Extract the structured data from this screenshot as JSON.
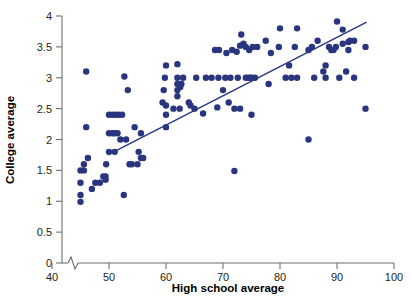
{
  "chart_data": {
    "type": "scatter",
    "title": "",
    "xlabel": "High school average",
    "ylabel": "College average",
    "xlim": [
      37,
      101
    ],
    "ylim": [
      0,
      4
    ],
    "x_ticks": [
      40,
      50,
      60,
      70,
      80,
      90,
      100
    ],
    "y_ticks": [
      0,
      0.5,
      1,
      1.5,
      2,
      2.5,
      3,
      3.5,
      4
    ],
    "x_tick_labels": [
      "40",
      "50",
      "60",
      "70",
      "80",
      "90",
      "100"
    ],
    "y_tick_labels": [
      "0",
      "0.5",
      "1",
      "1.5",
      "2",
      "2.5",
      "3",
      "3.5",
      "4"
    ],
    "grid": false,
    "legend": "none",
    "axis_break": {
      "axis": "x",
      "note": "zigzag break between 0 and 40"
    },
    "marker_color": "#2a3580",
    "marker_size": 3.2,
    "line_color": "#2a3580",
    "trend_line": {
      "type": "linear-fit",
      "x_start": 49.8,
      "y_start": 1.75,
      "x_end": 95.2,
      "y_end": 3.9
    },
    "series": [
      {
        "name": "students",
        "points": [
          [
            45,
            0.99
          ],
          [
            45,
            1.1
          ],
          [
            45,
            1.3
          ],
          [
            45,
            1.5
          ],
          [
            45.6,
            1.5
          ],
          [
            45.6,
            1.6
          ],
          [
            46,
            2.2
          ],
          [
            46,
            3.1
          ],
          [
            46.3,
            1.7
          ],
          [
            47,
            1.2
          ],
          [
            47.6,
            1.3
          ],
          [
            48.4,
            1.3
          ],
          [
            49,
            1.4
          ],
          [
            49.4,
            1.4
          ],
          [
            49.4,
            1.35
          ],
          [
            49.5,
            1.6
          ],
          [
            50,
            1.8
          ],
          [
            50,
            2.1
          ],
          [
            50,
            2.4
          ],
          [
            50.6,
            2.1
          ],
          [
            50.6,
            2.4
          ],
          [
            51,
            1.8
          ],
          [
            51,
            2.1
          ],
          [
            51.2,
            2.4
          ],
          [
            51.5,
            2.1
          ],
          [
            51.7,
            2.4
          ],
          [
            52,
            2.0
          ],
          [
            52.3,
            2.4
          ],
          [
            52.6,
            1.1
          ],
          [
            52.7,
            3.02
          ],
          [
            53,
            2.0
          ],
          [
            53.3,
            2.8
          ],
          [
            53.6,
            1.6
          ],
          [
            54,
            1.6
          ],
          [
            54.5,
            2.2
          ],
          [
            55,
            1.6
          ],
          [
            55.2,
            1.8
          ],
          [
            55.6,
            1.7
          ],
          [
            55.6,
            2.1
          ],
          [
            56,
            1.7
          ],
          [
            59.4,
            2.6
          ],
          [
            59.6,
            2.8
          ],
          [
            59.8,
            3.0
          ],
          [
            60,
            2.2
          ],
          [
            60,
            2.4
          ],
          [
            60,
            2.55
          ],
          [
            60,
            3.2
          ],
          [
            61.3,
            2.5
          ],
          [
            62,
            2.7
          ],
          [
            62,
            2.8
          ],
          [
            62,
            2.9
          ],
          [
            62,
            3.0
          ],
          [
            62,
            3.22
          ],
          [
            62.4,
            2.5
          ],
          [
            62.5,
            2.85
          ],
          [
            62.7,
            2.9
          ],
          [
            63,
            3.0
          ],
          [
            64,
            2.6
          ],
          [
            64.3,
            2.55
          ],
          [
            65,
            2.5
          ],
          [
            65.3,
            3.0
          ],
          [
            66.5,
            2.42
          ],
          [
            67,
            3.0
          ],
          [
            68,
            3.0
          ],
          [
            68.6,
            3.45
          ],
          [
            69,
            2.52
          ],
          [
            69.2,
            3.0
          ],
          [
            69.3,
            3.45
          ],
          [
            70,
            2.8
          ],
          [
            70.4,
            3.0
          ],
          [
            70.6,
            3.4
          ],
          [
            71,
            2.6
          ],
          [
            71.3,
            3.0
          ],
          [
            71.6,
            3.45
          ],
          [
            72,
            1.49
          ],
          [
            72,
            2.5
          ],
          [
            72.4,
            3.42
          ],
          [
            72.6,
            3.0
          ],
          [
            73,
            2.5
          ],
          [
            73,
            3.52
          ],
          [
            73.2,
            3.7
          ],
          [
            73.6,
            3.55
          ],
          [
            74,
            3.0
          ],
          [
            74,
            3.5
          ],
          [
            74.4,
            3.0
          ],
          [
            74.6,
            3.45
          ],
          [
            74.8,
            3.0
          ],
          [
            75,
            2.4
          ],
          [
            75,
            3.0
          ],
          [
            75.2,
            3.5
          ],
          [
            75.6,
            3.0
          ],
          [
            76,
            3.5
          ],
          [
            77.5,
            3.6
          ],
          [
            78,
            2.9
          ],
          [
            78.4,
            3.4
          ],
          [
            79.8,
            3.5
          ],
          [
            80,
            3.8
          ],
          [
            81,
            3.0
          ],
          [
            81.6,
            3.2
          ],
          [
            82,
            3.0
          ],
          [
            82.6,
            3.5
          ],
          [
            83,
            3.0
          ],
          [
            83,
            3.8
          ],
          [
            85,
            2.0
          ],
          [
            85,
            3.45
          ],
          [
            85.6,
            3.5
          ],
          [
            86,
            3.0
          ],
          [
            86.6,
            3.6
          ],
          [
            87.6,
            3.1
          ],
          [
            88,
            3.0
          ],
          [
            88,
            3.2
          ],
          [
            88.6,
            3.5
          ],
          [
            89,
            3.45
          ],
          [
            89.4,
            3.45
          ],
          [
            89.8,
            3.5
          ],
          [
            90,
            3.91
          ],
          [
            90.4,
            3.0
          ],
          [
            91,
            3.55
          ],
          [
            91,
            3.78
          ],
          [
            91.6,
            3.1
          ],
          [
            92,
            3.45
          ],
          [
            92,
            3.58
          ],
          [
            92.3,
            3.6
          ],
          [
            93,
            3.0
          ],
          [
            93,
            3.6
          ],
          [
            95,
            2.5
          ],
          [
            95,
            3.5
          ]
        ]
      }
    ]
  },
  "labels": {
    "x_axis_title": "High school average",
    "y_axis_title": "College average"
  }
}
